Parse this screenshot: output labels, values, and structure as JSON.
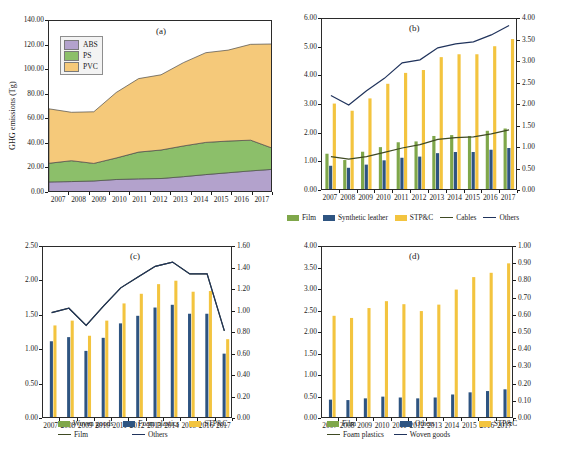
{
  "figure": {
    "caption": ""
  },
  "panels": {
    "a": {
      "tag": "(a)",
      "ylabel": "GHG emissions (Tg)",
      "legend": [
        {
          "label": "ABS",
          "color": "#b3a2cc"
        },
        {
          "label": "PS",
          "color": "#8cbf6a"
        },
        {
          "label": "PVC",
          "color": "#f5c97a"
        }
      ]
    },
    "b": {
      "tag": "(b)",
      "legend": [
        {
          "label": "Film",
          "color": "#7fa74a",
          "kind": "swatch"
        },
        {
          "label": "Synthetic leather",
          "color": "#2e5481",
          "kind": "swatch"
        },
        {
          "label": "STP&C",
          "color": "#f3c43f",
          "kind": "swatch"
        },
        {
          "label": "Cables",
          "color": "#3f4a23",
          "kind": "line"
        },
        {
          "label": "Others",
          "color": "#20335c",
          "kind": "line"
        }
      ]
    },
    "c": {
      "tag": "(c)",
      "legend": [
        {
          "label": "Woven goods",
          "color": "#7fa74a",
          "kind": "swatch"
        },
        {
          "label": "Foam plastics",
          "color": "#2e5481",
          "kind": "swatch"
        },
        {
          "label": "STP&C",
          "color": "#f3c43f",
          "kind": "swatch"
        },
        {
          "label": "Film",
          "color": "#3f4a23",
          "kind": "line"
        },
        {
          "label": "Others",
          "color": "#20335c",
          "kind": "line"
        }
      ]
    },
    "d": {
      "tag": "(d)",
      "legend": [
        {
          "label": "Film",
          "color": "#7fa74a",
          "kind": "swatch"
        },
        {
          "label": "Others",
          "color": "#2e5481",
          "kind": "swatch"
        },
        {
          "label": "STP&C",
          "color": "#f3c43f",
          "kind": "swatch"
        },
        {
          "label": "Foam plastics",
          "color": "#3f4a23",
          "kind": "line"
        },
        {
          "label": "Woven goods",
          "color": "#20335c",
          "kind": "line"
        }
      ]
    }
  },
  "chart_data": [
    {
      "id": "a",
      "type": "area",
      "title": "(a)",
      "xlabel": "",
      "ylabel": "GHG emissions (Tg)",
      "x": [
        2007,
        2008,
        2009,
        2010,
        2011,
        2012,
        2013,
        2014,
        2015,
        2016,
        2017
      ],
      "xtick_labels": [
        "2007",
        "2008",
        "2009",
        "2010",
        "2011",
        "2012",
        "2013",
        "2014",
        "2015",
        "2016",
        "2017"
      ],
      "ylim": [
        0,
        140
      ],
      "ytick_labels": [
        "0.00",
        "20.00",
        "40.00",
        "60.00",
        "80.00",
        "100.00",
        "120.00",
        "140.00"
      ],
      "stacked": true,
      "grid": false,
      "legend_position": "inside-top-left",
      "series": [
        {
          "name": "ABS",
          "color": "#b3a2cc",
          "values": [
            9.0,
            9.3,
            9.8,
            11.0,
            11.5,
            11.8,
            13.3,
            15.0,
            16.5,
            18.0,
            19.3
          ]
        },
        {
          "name": "PS",
          "color": "#8cbf6a",
          "values": [
            15.2,
            17.0,
            14.3,
            17.5,
            21.8,
            23.2,
            25.0,
            26.2,
            25.8,
            25.0,
            17.0
          ]
        },
        {
          "name": "PVC",
          "color": "#f5c97a",
          "values": [
            44.3,
            39.4,
            42.0,
            53.3,
            59.8,
            61.2,
            67.8,
            73.0,
            74.0,
            78.0,
            85.0
          ]
        }
      ],
      "stack_tops": [
        68.5,
        65.7,
        66.1,
        81.8,
        93.1,
        96.2,
        106.1,
        114.2,
        116.3,
        121.0,
        121.3
      ]
    },
    {
      "id": "b",
      "type": "bar-line",
      "title": "(b)",
      "xlabel": "",
      "ylabel": "",
      "x": [
        2007,
        2008,
        2009,
        2010,
        2011,
        2012,
        2013,
        2014,
        2015,
        2016,
        2017
      ],
      "xtick_labels": [
        "2007",
        "2008",
        "2009",
        "2010",
        "2011",
        "2012",
        "2013",
        "2014",
        "2015",
        "2016",
        "2017"
      ],
      "ylim": [
        0,
        6
      ],
      "ytick_labels": [
        "0.00",
        "1.00",
        "2.00",
        "3.00",
        "4.00",
        "5.00",
        "6.00"
      ],
      "y2lim": [
        0,
        4
      ],
      "y2tick_labels": [
        "0.00",
        "0.50",
        "1.00",
        "1.50",
        "2.00",
        "2.50",
        "3.00",
        "3.50",
        "4.00"
      ],
      "grid": false,
      "legend_position": "below",
      "bar_series": [
        {
          "name": "Film",
          "color": "#7fa74a",
          "axis": "left",
          "values": [
            1.3,
            1.08,
            1.37,
            1.53,
            1.7,
            1.73,
            1.92,
            1.95,
            1.92,
            2.1,
            2.18
          ]
        },
        {
          "name": "Synthetic leather",
          "color": "#2e5481",
          "axis": "left",
          "values": [
            0.88,
            0.81,
            0.92,
            1.07,
            1.16,
            1.2,
            1.32,
            1.36,
            1.36,
            1.44,
            1.5
          ]
        },
        {
          "name": "STP&C",
          "color": "#f3c43f",
          "axis": "left",
          "values": [
            3.05,
            2.8,
            3.23,
            3.74,
            4.12,
            4.22,
            4.67,
            4.77,
            4.77,
            5.05,
            5.3
          ]
        }
      ],
      "line_series": [
        {
          "name": "Cables",
          "color": "#3f4a23",
          "axis": "right",
          "values": [
            0.8,
            0.74,
            0.8,
            0.9,
            1.0,
            1.08,
            1.2,
            1.24,
            1.26,
            1.33,
            1.42
          ]
        },
        {
          "name": "Others",
          "color": "#20335c",
          "axis": "right",
          "values": [
            2.22,
            2.0,
            2.33,
            2.62,
            2.98,
            3.05,
            3.33,
            3.42,
            3.47,
            3.63,
            3.85
          ]
        }
      ]
    },
    {
      "id": "c",
      "type": "bar-line",
      "title": "(c)",
      "xlabel": "",
      "ylabel": "",
      "x": [
        2007,
        2008,
        2009,
        2010,
        2011,
        2012,
        2013,
        2014,
        2015,
        2016,
        2017
      ],
      "xtick_labels": [
        "2007",
        "2008",
        "2009",
        "2010",
        "2011",
        "2012",
        "2013",
        "2014",
        "2015",
        "2016",
        "2017"
      ],
      "ylim": [
        0,
        2.5
      ],
      "ytick_labels": [
        "0.00",
        "0.50",
        "1.00",
        "1.50",
        "2.00",
        "2.50"
      ],
      "y2lim": [
        0,
        1.6
      ],
      "y2tick_labels": [
        "0.00",
        "0.20",
        "0.40",
        "0.60",
        "0.80",
        "1.00",
        "1.20",
        "1.40",
        "1.60"
      ],
      "grid": false,
      "legend_position": "below",
      "bar_series": [
        {
          "name": "Woven goods",
          "color": "#7fa74a",
          "axis": "left",
          "values": [
            0.02,
            0.02,
            0.02,
            0.02,
            0.02,
            0.02,
            0.02,
            0.02,
            0.02,
            0.02,
            0.02
          ]
        },
        {
          "name": "Foam plastics",
          "color": "#2e5481",
          "axis": "left",
          "values": [
            1.13,
            1.19,
            0.99,
            1.18,
            1.39,
            1.5,
            1.62,
            1.66,
            1.53,
            1.53,
            0.95
          ]
        },
        {
          "name": "STP&C",
          "color": "#f3c43f",
          "axis": "left",
          "values": [
            1.36,
            1.43,
            1.21,
            1.43,
            1.68,
            1.82,
            1.96,
            2.01,
            1.85,
            1.86,
            1.16
          ]
        }
      ],
      "line_series": [
        {
          "name": "Film",
          "color": "#3f4a23",
          "axis": "right",
          "values": [
            0.99,
            1.03,
            0.87,
            1.05,
            1.22,
            1.32,
            1.42,
            1.46,
            1.35,
            1.35,
            0.82
          ]
        },
        {
          "name": "Others",
          "color": "#20335c",
          "axis": "right",
          "values": [
            0.99,
            1.03,
            0.87,
            1.05,
            1.22,
            1.32,
            1.42,
            1.46,
            1.35,
            1.35,
            0.82
          ]
        }
      ]
    },
    {
      "id": "d",
      "type": "bar",
      "title": "(d)",
      "xlabel": "",
      "ylabel": "",
      "x": [
        2007,
        2008,
        2009,
        2010,
        2011,
        2012,
        2013,
        2014,
        2015,
        2016,
        2017
      ],
      "xtick_labels": [
        "2007",
        "2008",
        "2009",
        "2010",
        "2011",
        "2012",
        "2013",
        "2014",
        "2015",
        "2016",
        "2017"
      ],
      "ylim": [
        0,
        4
      ],
      "ytick_labels": [
        "0.00",
        "0.50",
        "1.00",
        "1.50",
        "2.00",
        "2.50",
        "3.00",
        "3.50",
        "4.00"
      ],
      "y2lim": [
        0,
        1.0
      ],
      "y2tick_labels": [
        "0.00",
        "0.10",
        "0.20",
        "0.30",
        "0.40",
        "0.50",
        "0.60",
        "0.70",
        "0.80",
        "0.90",
        "1.00"
      ],
      "grid": false,
      "legend_position": "below",
      "bar_series": [
        {
          "name": "Film",
          "color": "#7fa74a",
          "axis": "left",
          "values": [
            0.01,
            0.01,
            0.01,
            0.01,
            0.01,
            0.01,
            0.01,
            0.01,
            0.01,
            0.01,
            0.01
          ]
        },
        {
          "name": "Others",
          "color": "#2e5481",
          "axis": "left",
          "values": [
            0.45,
            0.44,
            0.48,
            0.52,
            0.5,
            0.48,
            0.5,
            0.57,
            0.62,
            0.65,
            0.69
          ]
        },
        {
          "name": "STP&C",
          "color": "#f3c43f",
          "axis": "left",
          "values": [
            2.4,
            2.35,
            2.58,
            2.74,
            2.67,
            2.51,
            2.66,
            3.01,
            3.3,
            3.4,
            3.62
          ]
        }
      ],
      "line_series": []
    }
  ]
}
